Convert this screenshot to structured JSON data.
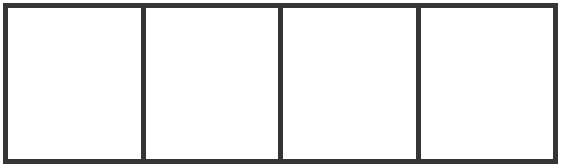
{
  "diagram": {
    "type": "panel-strip",
    "panel_count": 4,
    "panels": [
      {
        "index": 1,
        "content": ""
      },
      {
        "index": 2,
        "content": ""
      },
      {
        "index": 3,
        "content": ""
      },
      {
        "index": 4,
        "content": ""
      }
    ],
    "colors": {
      "border": "#353535",
      "background": "#ffffff"
    }
  }
}
